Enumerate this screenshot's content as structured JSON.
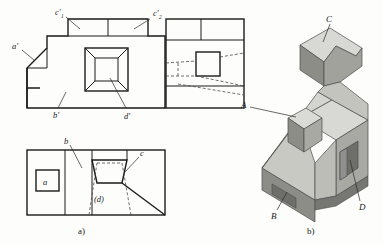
{
  "figure": {
    "type": "engineering-orthographic-and-isometric-drawing",
    "captions": {
      "left": "a)",
      "right": "b)"
    }
  },
  "orthographic": {
    "front_view": {
      "name": "front-view",
      "labels": [
        {
          "id": "a-prime",
          "text": "a′",
          "x": 14,
          "y": 48
        },
        {
          "id": "c-prime-1",
          "text": "c′",
          "sub": "1",
          "x": 58,
          "y": 14
        },
        {
          "id": "c-prime-2",
          "text": "c′",
          "sub": "2",
          "x": 152,
          "y": 16
        },
        {
          "id": "b-prime",
          "text": "b′",
          "x": 56,
          "y": 112
        },
        {
          "id": "d-prime",
          "text": "d′",
          "x": 127,
          "y": 113
        }
      ]
    },
    "side_view": {
      "name": "side-view",
      "labels": []
    },
    "top_view": {
      "name": "top-view",
      "labels": [
        {
          "id": "b",
          "text": "b",
          "x": 67,
          "y": 143
        },
        {
          "id": "c",
          "text": "c",
          "x": 141,
          "y": 155
        },
        {
          "id": "a-boxed",
          "text": "a",
          "x": 42,
          "y": 181
        },
        {
          "id": "d-paren",
          "text": "(d)",
          "x": 94,
          "y": 199
        }
      ]
    }
  },
  "isometric": {
    "name": "isometric-view",
    "labels": [
      {
        "id": "C",
        "text": "C",
        "x": 328,
        "y": 16
      },
      {
        "id": "A",
        "text": "A",
        "x": 243,
        "y": 104
      },
      {
        "id": "B",
        "text": "B",
        "x": 274,
        "y": 214
      },
      {
        "id": "D",
        "text": "D",
        "x": 362,
        "y": 205
      }
    ]
  },
  "colors": {
    "line": "#1a1a1a",
    "hidden_line": "#555555",
    "face_top": "#d8d8d4",
    "face_front": "#c9c9c4",
    "face_side": "#a9a9a4",
    "face_dark": "#8d8d88",
    "face_darkest": "#767672",
    "background": "#fdfdfc"
  }
}
